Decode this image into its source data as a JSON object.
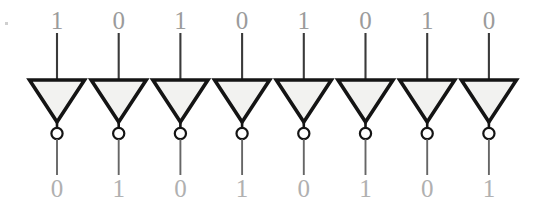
{
  "figure": {
    "width": 545,
    "height": 215,
    "background_color": "#ffffff"
  },
  "colors": {
    "gate_outline": "#141414",
    "gate_fill": "#f2f2f0",
    "input_wire": "#3a3a3a",
    "output_wire": "#666666",
    "input_digit": "#9b9b9b",
    "output_digit": "#b0b0b0",
    "bubble_fill": "#ffffff"
  },
  "geometry": {
    "first_gate_center_x": 57,
    "gate_spacing_x": 61.7,
    "gate_half_width": 27.5,
    "gate_top_y": 80,
    "gate_apex_y": 122,
    "bubble_center_y": 133.5,
    "bubble_radius": 5.6,
    "input_wire_top_y": 33,
    "output_wire_bottom_y": 175,
    "input_digit_baseline_y": 29,
    "output_digit_baseline_y": 197
  },
  "gates": [
    {
      "index": 1,
      "name": "inverter-1",
      "type": "NOT",
      "input": "1",
      "output": "0",
      "center_x": 57
    },
    {
      "index": 2,
      "name": "inverter-2",
      "type": "NOT",
      "input": "0",
      "output": "1",
      "center_x": 118.7
    },
    {
      "index": 3,
      "name": "inverter-3",
      "type": "NOT",
      "input": "1",
      "output": "0",
      "center_x": 180.4
    },
    {
      "index": 4,
      "name": "inverter-4",
      "type": "NOT",
      "input": "0",
      "output": "1",
      "center_x": 242.1
    },
    {
      "index": 5,
      "name": "inverter-5",
      "type": "NOT",
      "input": "1",
      "output": "0",
      "center_x": 303.8
    },
    {
      "index": 6,
      "name": "inverter-6",
      "type": "NOT",
      "input": "0",
      "output": "1",
      "center_x": 365.5
    },
    {
      "index": 7,
      "name": "inverter-7",
      "type": "NOT",
      "input": "1",
      "output": "0",
      "center_x": 427.2
    },
    {
      "index": 8,
      "name": "inverter-8",
      "type": "NOT",
      "input": "0",
      "output": "1",
      "center_x": 488.9
    }
  ],
  "input_row": {
    "label": "input bits",
    "values": [
      "1",
      "0",
      "1",
      "0",
      "1",
      "0",
      "1",
      "0"
    ]
  },
  "output_row": {
    "label": "output bits",
    "values": [
      "0",
      "1",
      "0",
      "1",
      "0",
      "1",
      "0",
      "1"
    ]
  },
  "artifacts": [
    {
      "name": "scan-speck",
      "x": 5,
      "y": 22,
      "w": 3,
      "h": 3
    }
  ]
}
